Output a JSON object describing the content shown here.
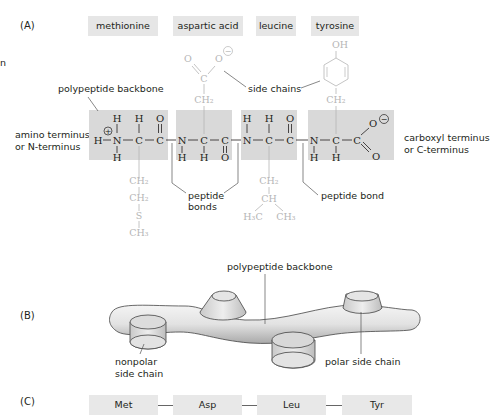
{
  "panels": {
    "a": "(A)",
    "b": "(B)",
    "c": "(C)"
  },
  "amino_acids": [
    "methionine",
    "aspartic acid",
    "leucine",
    "tyrosine"
  ],
  "panel_a": {
    "labels": {
      "backbone": "polypeptide backbone",
      "side_chains": "side chains",
      "n_terminus_1": "amino terminus",
      "n_terminus_2": "or N-terminus",
      "c_terminus_1": "carboxyl terminus",
      "c_terminus_2": "or C-terminus",
      "peptide_bonds_1": "peptide",
      "peptide_bonds_2": "bonds",
      "peptide_bond": "peptide bond",
      "stray_n": "n"
    },
    "atoms": {
      "H": "H",
      "N": "N",
      "C": "C",
      "O": "O",
      "CH2": "CH₂",
      "CH": "CH",
      "CH3": "CH₃",
      "H3C": "H₃C",
      "S": "S",
      "OH": "OH",
      "plus": "+",
      "minus": "−"
    }
  },
  "panel_b": {
    "backbone": "polypeptide backbone",
    "nonpolar_1": "nonpolar",
    "nonpolar_2": "side chain",
    "polar": "polar side chain"
  },
  "panel_c": {
    "sequence": [
      "Met",
      "Asp",
      "Leu",
      "Tyr"
    ]
  },
  "colors": {
    "box_fill": "#d9d9d9",
    "side_chain": "#b5b5b5",
    "text": "#231f20"
  }
}
